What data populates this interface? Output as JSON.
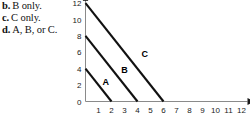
{
  "options": [
    {
      "marker": "b.",
      "text": "B only."
    },
    {
      "marker": "c.",
      "text": "C only."
    },
    {
      "marker": "d.",
      "text": "A, B, or C."
    }
  ],
  "chart_data": {
    "type": "line",
    "title": "",
    "xlabel": "X",
    "ylabel": "",
    "xlim": [
      0,
      12
    ],
    "ylim": [
      0,
      12
    ],
    "xticks": [
      1,
      2,
      3,
      4,
      5,
      6,
      7,
      8,
      9,
      10,
      11,
      12
    ],
    "yticks": [
      0,
      2,
      4,
      6,
      8,
      10,
      12
    ],
    "grid": false,
    "legend": "inline-labels",
    "series": [
      {
        "name": "A",
        "label_position": {
          "x": 1.55,
          "y": 2.05
        },
        "x": [
          0,
          2
        ],
        "y": [
          4,
          0
        ],
        "slope": -2,
        "y_intercept": 4,
        "x_intercept": 2
      },
      {
        "name": "B",
        "label_position": {
          "x": 3.0,
          "y": 3.5
        },
        "x": [
          0,
          4
        ],
        "y": [
          8,
          0
        ],
        "slope": -2,
        "y_intercept": 8,
        "x_intercept": 4
      },
      {
        "name": "C",
        "label_position": {
          "x": 4.55,
          "y": 5.45
        },
        "x": [
          0,
          6
        ],
        "y": [
          12,
          0
        ],
        "slope": -2,
        "y_intercept": 12,
        "x_intercept": 6
      }
    ]
  },
  "colors": {
    "curve": "#111111",
    "axis": "#8a8a8a",
    "text": "#111111",
    "background": "#ffffff"
  }
}
